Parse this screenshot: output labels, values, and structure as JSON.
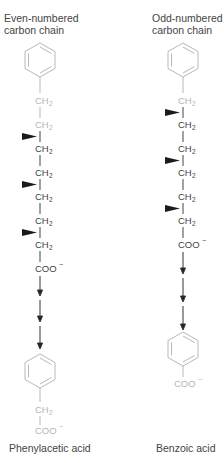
{
  "left": {
    "title_line1": "Even-numbered",
    "title_line2": "carbon chain",
    "chain": [
      "CH",
      "CH",
      "CH",
      "CH",
      "CH",
      "CH"
    ],
    "subscript": "2",
    "carboxylate": "COO",
    "charge": "−",
    "product_ch2": "CH",
    "product_coo": "COO",
    "product_label": "Phenylacetic acid"
  },
  "right": {
    "title_line1": "Odd-numbered",
    "title_line2": "carbon chain",
    "chain": [
      "CH",
      "CH",
      "CH",
      "CH",
      "CH"
    ],
    "subscript": "2",
    "carboxylate": "COO",
    "charge": "−",
    "product_coo": "COO",
    "product_label": "Benzoic acid"
  },
  "colors": {
    "text": "#333333",
    "faded": "#b5b5b5",
    "arrow": "#222222"
  }
}
